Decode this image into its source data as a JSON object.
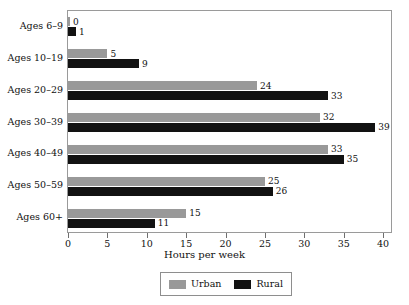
{
  "chart_data": {
    "type": "bar",
    "orientation": "horizontal",
    "title": "",
    "xlabel": "Hours per week",
    "ylabel": "",
    "xlim": [
      0,
      41
    ],
    "xticks": [
      0,
      5,
      10,
      15,
      20,
      25,
      30,
      35,
      40
    ],
    "grid": false,
    "legend_position": "bottom-center",
    "categories": [
      "Ages 6–9",
      "Ages 10–19",
      "Ages 20–29",
      "Ages 30–39",
      "Ages 40–49",
      "Ages 50–59",
      "Ages 60+"
    ],
    "series": [
      {
        "name": "Urban",
        "color": "#999999",
        "values": [
          0,
          5,
          24,
          32,
          33,
          25,
          15
        ],
        "labels": [
          "0",
          "5",
          "24",
          "32",
          "33",
          "25",
          "15"
        ]
      },
      {
        "name": "Rural",
        "color": "#121212",
        "values": [
          1,
          9,
          33,
          39,
          35,
          26,
          11
        ],
        "labels": [
          "1",
          "9",
          "33",
          "39",
          "35",
          "26",
          "11"
        ]
      }
    ]
  },
  "axis": {
    "x_title": "Hours per week",
    "tick_labels": [
      "0",
      "5",
      "10",
      "15",
      "20",
      "25",
      "30",
      "35",
      "40"
    ]
  },
  "legend": {
    "entries": [
      {
        "label": "Urban",
        "color": "#999999"
      },
      {
        "label": "Rural",
        "color": "#121212"
      }
    ]
  }
}
